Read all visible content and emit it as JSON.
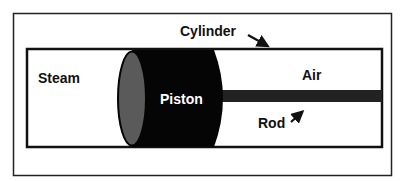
{
  "diagram": {
    "labels": {
      "cylinder": "Cylinder",
      "steam": "Steam",
      "piston": "Piston",
      "air": "Air",
      "rod": "Rod"
    },
    "colors": {
      "background": "#ffffff",
      "frame": "#222222",
      "piston_body": "#050505",
      "piston_face": "#5a5a5a",
      "rod": "#222222",
      "text": "#111111",
      "piston_text": "#ffffff"
    }
  }
}
